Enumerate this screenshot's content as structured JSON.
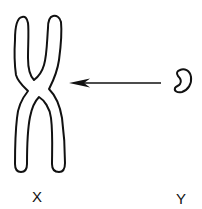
{
  "diagram": {
    "type": "chromosome-illustration",
    "elements": [
      {
        "id": "x-chromosome",
        "shape": "X-shaped chromosome outline",
        "label": "X"
      },
      {
        "id": "y-chromosome",
        "shape": "small bean-shaped chromosome outline",
        "label": "Y"
      },
      {
        "id": "arrow",
        "from": "Y",
        "to": "X",
        "direction": "right-to-left"
      }
    ],
    "labels": {
      "x": "X",
      "y": "Y"
    },
    "colors": {
      "stroke": "#111111",
      "background": "#ffffff"
    }
  }
}
